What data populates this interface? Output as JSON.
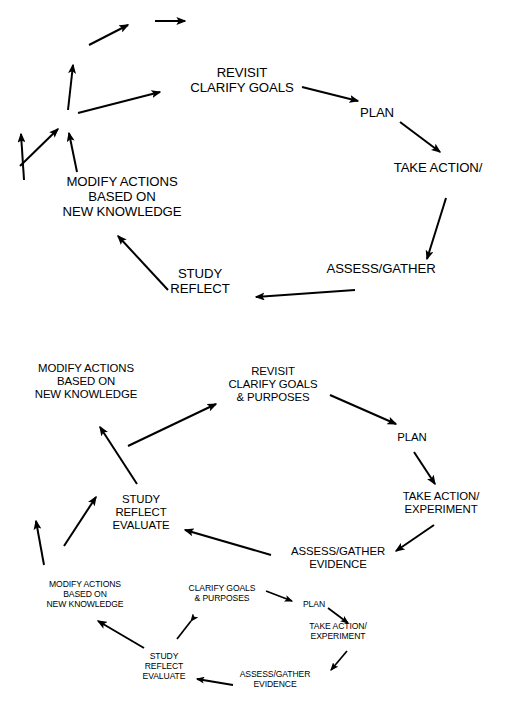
{
  "figure": {
    "line_color": "#000000",
    "background_color": "#ffffff",
    "width": 517,
    "height": 715
  },
  "cycles": [
    {
      "id": "inner",
      "scale": "small",
      "nodes": {
        "clarify": {
          "lines": [
            "CLARIFY GOALS",
            "& PURPOSES"
          ],
          "x": 222,
          "y": 594
        },
        "plan": {
          "lines": [
            "PLAN"
          ],
          "x": 314,
          "y": 605
        },
        "action": {
          "lines": [
            "TAKE ACTION/",
            "EXPERIMENT"
          ],
          "x": 338,
          "y": 632
        },
        "assess": {
          "lines": [
            "ASSESS/GATHER",
            "EVIDENCE"
          ],
          "x": 275,
          "y": 680
        },
        "study": {
          "lines": [
            "STUDY",
            "REFLECT",
            "EVALUATE"
          ],
          "x": 164,
          "y": 667
        },
        "modify": {
          "lines": [
            "MODIFY ACTIONS",
            "BASED ON",
            "NEW KNOWLEDGE"
          ],
          "x": 85,
          "y": 595
        }
      }
    },
    {
      "id": "middle",
      "scale": "medium",
      "nodes": {
        "clarify": {
          "lines": [
            "REVISIT",
            "CLARIFY GOALS",
            "& PURPOSES"
          ],
          "x": 273,
          "y": 385
        },
        "plan": {
          "lines": [
            "PLAN"
          ],
          "x": 412,
          "y": 438
        },
        "action": {
          "lines": [
            "TAKE ACTION/",
            "EXPERIMENT"
          ],
          "x": 441,
          "y": 503
        },
        "assess": {
          "lines": [
            "ASSESS/GATHER",
            "EVIDENCE"
          ],
          "x": 338,
          "y": 558
        },
        "study": {
          "lines": [
            "STUDY",
            "REFLECT",
            "EVALUATE"
          ],
          "x": 141,
          "y": 513
        },
        "modify": {
          "lines": [
            "MODIFY ACTIONS",
            "BASED ON",
            "NEW KNOWLEDGE"
          ],
          "x": 86,
          "y": 382
        }
      }
    },
    {
      "id": "outer",
      "scale": "large",
      "nodes": {
        "clarify": {
          "lines": [
            "REVISIT",
            "CLARIFY GOALS"
          ],
          "x": 242,
          "y": 80
        },
        "plan": {
          "lines": [
            "PLAN"
          ],
          "x": 377,
          "y": 113
        },
        "action": {
          "lines": [
            "TAKE ACTION/"
          ],
          "x": 438,
          "y": 168
        },
        "assess": {
          "lines": [
            "ASSESS/GATHER"
          ],
          "x": 381,
          "y": 269
        },
        "study": {
          "lines": [
            "STUDY",
            "REFLECT"
          ],
          "x": 200,
          "y": 281
        },
        "modify": {
          "lines": [
            "MODIFY ACTIONS",
            "BASED ON",
            "NEW KNOWLEDGE"
          ],
          "x": 122,
          "y": 197
        }
      }
    }
  ],
  "continuation": {
    "label": "spiral continues outward",
    "arrows": 2
  },
  "stage_sequence": [
    "CLARIFY GOALS & PURPOSES",
    "PLAN",
    "TAKE ACTION/EXPERIMENT",
    "ASSESS/GATHER EVIDENCE",
    "STUDY REFLECT EVALUATE",
    "MODIFY ACTIONS BASED ON NEW KNOWLEDGE"
  ]
}
